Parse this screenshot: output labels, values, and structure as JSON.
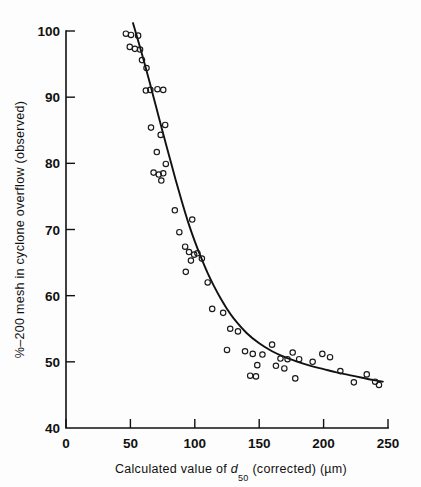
{
  "figure": {
    "background_color": "#fdfdfd",
    "ink_color": "#111111"
  },
  "chart_data": {
    "type": "scatter",
    "title": "",
    "xlabel_parts": {
      "lead": "Calculated value of ",
      "symbol": "d",
      "subscript": "50",
      "tail": " (corrected) (µm)"
    },
    "xlabel": "Calculated value of d50 (corrected) (µm)",
    "ylabel": "%–200 mesh in cyclone overflow (observed)",
    "xlim": [
      0,
      250
    ],
    "ylim": [
      40,
      100
    ],
    "xticks": [
      0,
      50,
      100,
      150,
      200,
      250
    ],
    "xtick_labels": [
      "0",
      "50",
      "100",
      "150",
      "200",
      "250"
    ],
    "yticks": [
      40,
      50,
      60,
      70,
      80,
      90,
      100
    ],
    "ytick_labels": [
      "40",
      "50",
      "60",
      "70",
      "80",
      "90",
      "100"
    ],
    "ytick_labels_shown": [
      "50",
      "60",
      "70",
      "80",
      "90",
      "100"
    ],
    "grid": false,
    "legend": null,
    "marker": "open-circle",
    "points": [
      [
        46.5,
        99.6
      ],
      [
        50.5,
        99.4
      ],
      [
        56.0,
        99.3
      ],
      [
        49.5,
        97.6
      ],
      [
        53.5,
        97.3
      ],
      [
        57.5,
        97.2
      ],
      [
        59.0,
        95.6
      ],
      [
        62.5,
        94.4
      ],
      [
        62.0,
        91.0
      ],
      [
        65.5,
        91.1
      ],
      [
        71.0,
        91.2
      ],
      [
        75.5,
        91.1
      ],
      [
        66.0,
        85.4
      ],
      [
        77.0,
        85.8
      ],
      [
        73.5,
        84.3
      ],
      [
        70.5,
        81.7
      ],
      [
        68.0,
        78.6
      ],
      [
        72.0,
        78.3
      ],
      [
        75.5,
        78.5
      ],
      [
        77.5,
        79.9
      ],
      [
        74.0,
        77.4
      ],
      [
        84.5,
        72.9
      ],
      [
        88.0,
        69.6
      ],
      [
        98.0,
        71.5
      ],
      [
        92.5,
        67.4
      ],
      [
        95.5,
        66.6
      ],
      [
        99.5,
        66.2
      ],
      [
        97.0,
        65.3
      ],
      [
        102.0,
        66.4
      ],
      [
        105.5,
        65.6
      ],
      [
        93.0,
        63.6
      ],
      [
        110.0,
        62.0
      ],
      [
        113.5,
        58.0
      ],
      [
        122.0,
        57.4
      ],
      [
        127.5,
        55.0
      ],
      [
        133.5,
        54.6
      ],
      [
        125.0,
        51.8
      ],
      [
        139.0,
        51.6
      ],
      [
        145.0,
        51.2
      ],
      [
        152.5,
        51.1
      ],
      [
        148.5,
        49.5
      ],
      [
        143.0,
        47.9
      ],
      [
        147.5,
        47.8
      ],
      [
        160.0,
        52.6
      ],
      [
        166.5,
        50.5
      ],
      [
        172.0,
        50.4
      ],
      [
        163.0,
        49.4
      ],
      [
        169.5,
        49.0
      ],
      [
        176.0,
        51.4
      ],
      [
        181.0,
        50.4
      ],
      [
        178.0,
        47.5
      ],
      [
        191.5,
        50.0
      ],
      [
        199.0,
        51.2
      ],
      [
        205.0,
        50.7
      ],
      [
        213.0,
        48.6
      ],
      [
        223.5,
        46.9
      ],
      [
        233.5,
        48.1
      ],
      [
        240.0,
        47.0
      ],
      [
        243.0,
        46.5
      ]
    ],
    "fit_curve": {
      "description": "hand-drawn sigmoid / exponential-decay trend line",
      "points": [
        [
          52.0,
          101.2
        ],
        [
          55.0,
          99.2
        ],
        [
          60.0,
          95.8
        ],
        [
          65.0,
          92.2
        ],
        [
          70.0,
          88.5
        ],
        [
          75.0,
          84.8
        ],
        [
          80.0,
          81.2
        ],
        [
          85.0,
          77.6
        ],
        [
          90.0,
          74.2
        ],
        [
          95.0,
          71.0
        ],
        [
          100.0,
          68.2
        ],
        [
          105.0,
          65.7
        ],
        [
          110.0,
          63.4
        ],
        [
          115.0,
          61.4
        ],
        [
          120.0,
          59.6
        ],
        [
          125.0,
          58.0
        ],
        [
          130.0,
          56.6
        ],
        [
          140.0,
          54.4
        ],
        [
          150.0,
          52.8
        ],
        [
          160.0,
          51.6
        ],
        [
          170.0,
          50.7
        ],
        [
          180.0,
          50.0
        ],
        [
          190.0,
          49.4
        ],
        [
          200.0,
          48.9
        ],
        [
          210.0,
          48.4
        ],
        [
          220.0,
          48.0
        ],
        [
          230.0,
          47.6
        ],
        [
          240.0,
          47.2
        ],
        [
          246.0,
          47.0
        ]
      ]
    }
  }
}
